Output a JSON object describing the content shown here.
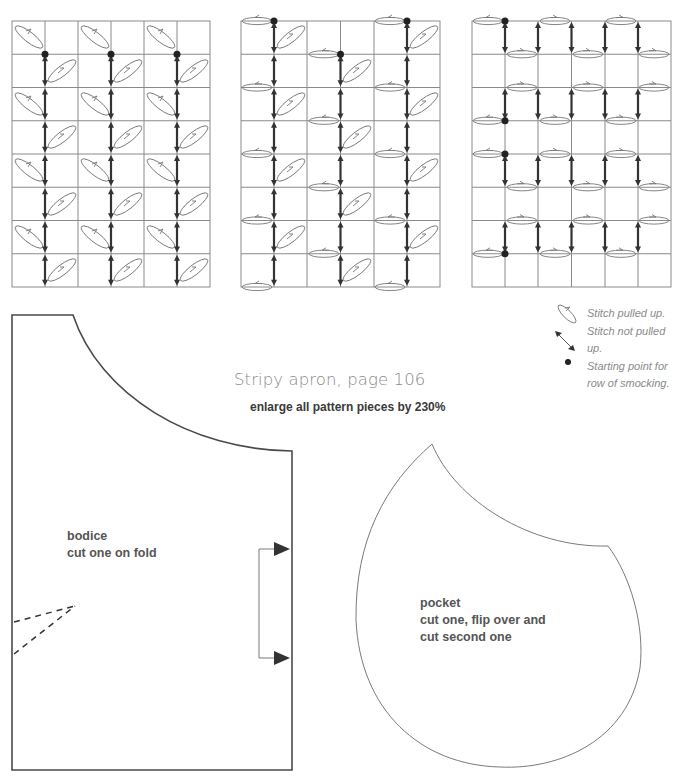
{
  "title": "Stripy apron, page 106",
  "subtitle": "enlarge all pattern pieces by 230%",
  "legend": {
    "items": [
      {
        "icon": "stitch-pulled-up-oval-icon",
        "lines": [
          "Stitch pulled up."
        ]
      },
      {
        "icon": "double-arrow-icon",
        "lines": [
          "Stitch not pulled",
          "up."
        ]
      },
      {
        "icon": "dot-icon",
        "lines": [
          "Starting point for",
          "row of smocking."
        ]
      }
    ]
  },
  "bodice": {
    "name": "bodice",
    "instruction": "cut one on fold",
    "has_dart": true,
    "fold_bracket": true
  },
  "pocket": {
    "name": "pocket",
    "instruction_line1": "cut one, flip over and",
    "instruction_line2": "cut second one"
  },
  "smocking_grids": [
    {
      "id": "grid-1",
      "columns": 6,
      "rows": 8,
      "stitch_oval_style": "diagonal"
    },
    {
      "id": "grid-2",
      "columns": 6,
      "rows": 8,
      "stitch_oval_style": "diagonal-and-horizontal"
    },
    {
      "id": "grid-3",
      "columns": 6,
      "rows": 8,
      "stitch_oval_style": "horizontal"
    }
  ],
  "colors": {
    "outline": "#4a4a4a",
    "grid": "#8a8a8a",
    "arrow": "#333333",
    "title_text": "#8a8a8a",
    "label_text": "#555555"
  }
}
